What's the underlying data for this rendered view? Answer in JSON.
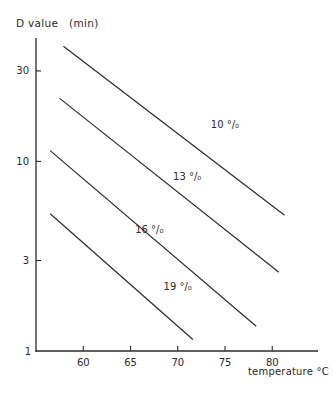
{
  "chart_data": {
    "type": "line",
    "title": "",
    "xlabel": "temperature °C",
    "ylabel": "D value   (min)",
    "xscale": "linear",
    "yscale": "log",
    "xlim": [
      55,
      84
    ],
    "ylim": [
      1,
      50
    ],
    "xticks": [
      60,
      65,
      70,
      75,
      80
    ],
    "yticks": [
      1,
      3,
      10,
      30
    ],
    "grid": false,
    "legend": "inline labels on lines",
    "series": [
      {
        "name": "10 °/₀",
        "x": [
          57.9,
          81.3
        ],
        "y": [
          40.5,
          5.2
        ],
        "label_pos": [
          73.5,
          15
        ]
      },
      {
        "name": "13 °/₀",
        "x": [
          57.5,
          80.7
        ],
        "y": [
          21.5,
          2.6
        ],
        "label_pos": [
          69.5,
          8
        ]
      },
      {
        "name": "16 °/₀",
        "x": [
          56.5,
          78.3
        ],
        "y": [
          11.4,
          1.35
        ],
        "label_pos": [
          65.5,
          4.2
        ]
      },
      {
        "name": "19 °/₀",
        "x": [
          56.5,
          71.6
        ],
        "y": [
          5.3,
          1.15
        ],
        "label_pos": [
          68.5,
          2.1
        ]
      }
    ]
  },
  "axes": {
    "y_title": "D value   (min)",
    "x_title": "temperature °C",
    "x_tick_labels": [
      "60",
      "65",
      "70",
      "75",
      "80"
    ],
    "y_tick_labels": [
      "1",
      "3",
      "10",
      "30"
    ]
  },
  "colors": {
    "line": "#2a2a2a",
    "background": "#ffffff"
  }
}
